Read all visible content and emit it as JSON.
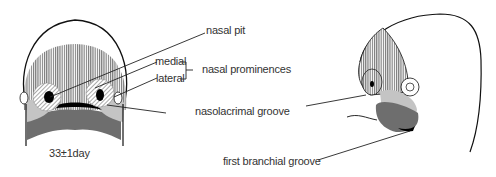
{
  "diagram": {
    "type": "embryology facial development illustration",
    "views": [
      "frontal view",
      "lateral view"
    ],
    "caption": "33±1day",
    "labels": {
      "nasal_pit": "nasal pit",
      "medial": "medial",
      "lateral": "lateral",
      "nasal_prominences": "nasal prominences",
      "nasolacrimal_groove": "nasolacrimal groove",
      "first_branchial_groove": "first branchial groove"
    },
    "colors": {
      "outline": "#111111",
      "frontonasal_hatch": "#555555",
      "maxillary": "#c4c4c4",
      "mandibular": "#6e6e6e",
      "stomodeum": "#000000",
      "text": "#333333"
    }
  }
}
